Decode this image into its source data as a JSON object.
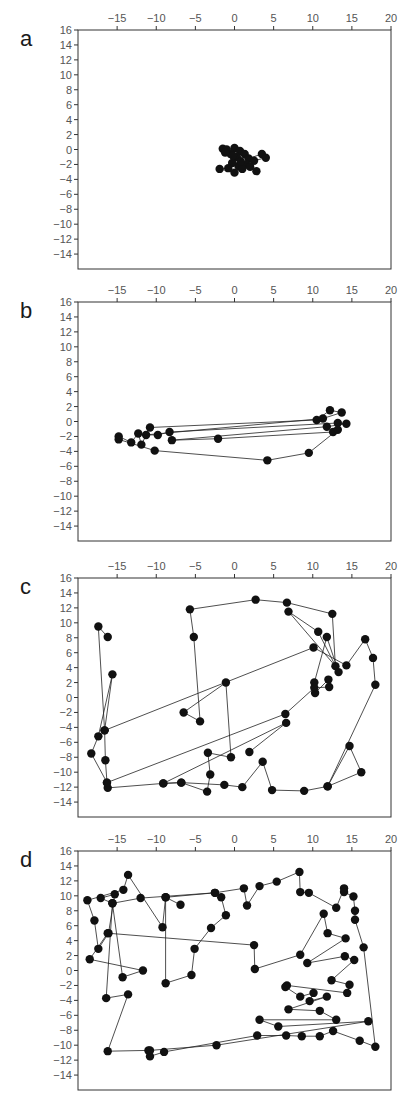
{
  "figure": {
    "axis_color": "#333333",
    "line_color": "#222222",
    "marker_color": "#111111",
    "tick_label_color": "#555555"
  },
  "chart_data": [
    {
      "type": "line",
      "panel_label": "a",
      "title": "",
      "xlabel": "",
      "ylabel": "",
      "xlim": [
        -20,
        20
      ],
      "ylim": [
        -16,
        16
      ],
      "xticks": [
        -15,
        -10,
        -5,
        0,
        5,
        10,
        15,
        20
      ],
      "yticks": [
        16,
        14,
        12,
        10,
        8,
        6,
        4,
        2,
        0,
        -2,
        -4,
        -6,
        -8,
        -10,
        -12,
        -14
      ],
      "x_axis_position": "top",
      "grid": false,
      "legend": null,
      "series": [
        {
          "name": "trajectory",
          "marker": "circle",
          "x": [
            -1.5,
            -1.0,
            0.0,
            0.7,
            1.3,
            -0.5,
            0.3,
            1.8,
            3.5,
            4.0,
            2.5,
            1.5,
            0.5,
            -0.3,
            -0.8,
            -1.9,
            0.0,
            1.0,
            2.0,
            2.8,
            -0.2,
            0.8,
            -1.2
          ],
          "y": [
            0.1,
            0.0,
            0.2,
            -0.2,
            -0.6,
            -0.6,
            -1.0,
            -1.2,
            -0.6,
            -1.1,
            -1.5,
            -2.0,
            -2.2,
            -1.8,
            -2.5,
            -2.6,
            -3.1,
            -2.6,
            -2.3,
            -2.9,
            -0.8,
            -1.6,
            -0.4
          ]
        }
      ]
    },
    {
      "type": "line",
      "panel_label": "b",
      "title": "",
      "xlabel": "",
      "ylabel": "",
      "xlim": [
        -20,
        20
      ],
      "ylim": [
        -16,
        16
      ],
      "xticks": [
        -15,
        -10,
        -5,
        0,
        5,
        10,
        15,
        20
      ],
      "yticks": [
        16,
        14,
        12,
        10,
        8,
        6,
        4,
        2,
        0,
        -2,
        -4,
        -6,
        -8,
        -10,
        -12,
        -14
      ],
      "x_axis_position": "top",
      "grid": false,
      "legend": null,
      "series": [
        {
          "name": "trajectory",
          "marker": "circle",
          "x": [
            -14.8,
            -13.2,
            -12.3,
            -11.9,
            -10.8,
            10.5,
            12.2,
            13.7,
            11.3,
            -11.3,
            -9.8,
            -8.3,
            13.2,
            14.3,
            11.8,
            -8.0,
            -2.1,
            12.6,
            13.2,
            9.5,
            4.2,
            -10.2,
            -14.8
          ],
          "y": [
            -2.0,
            -2.8,
            -1.6,
            -3.1,
            -0.8,
            0.2,
            1.5,
            1.2,
            0.4,
            -1.8,
            -1.8,
            -1.4,
            -0.2,
            -0.3,
            -0.7,
            -2.5,
            -2.3,
            -1.4,
            -1.1,
            -4.2,
            -5.2,
            -3.9,
            -2.4
          ]
        }
      ]
    },
    {
      "type": "line",
      "panel_label": "c",
      "title": "",
      "xlabel": "",
      "ylabel": "",
      "xlim": [
        -20,
        20
      ],
      "ylim": [
        -16,
        16
      ],
      "xticks": [
        -15,
        -10,
        -5,
        0,
        5,
        10,
        15,
        20
      ],
      "yticks": [
        16,
        14,
        12,
        10,
        8,
        6,
        4,
        2,
        0,
        -2,
        -4,
        -6,
        -8,
        -10,
        -12,
        -14
      ],
      "x_axis_position": "top",
      "grid": false,
      "legend": null,
      "series": [
        {
          "name": "trajectory",
          "marker": "circle",
          "x": [
            -16.2,
            -17.4,
            -16.6,
            -15.6,
            -17.4,
            -18.3,
            -16.3,
            -16.2,
            -9.1,
            -6.8,
            -3.5,
            -3.1,
            -3.4,
            -0.45,
            -1.1,
            -6.5,
            -4.4,
            -5.2,
            -5.7,
            2.7,
            6.7,
            12.5,
            12.9,
            6.9,
            10.7,
            13.3,
            11.8,
            10.2,
            10.3,
            12.0,
            12.1,
            10.2,
            6.5,
            -16.3,
            -16.5,
            -16.6,
            10.1,
            14.3,
            16.7,
            17.7,
            18.0,
            11.9,
            14.7,
            16.2,
            11.9,
            8.9,
            4.8,
            3.6,
            1.0,
            -1.3,
            -6.8,
            -9.1,
            6.6,
            1.9
          ],
          "y": [
            8.1,
            9.5,
            -4.4,
            3.1,
            -5.2,
            -7.5,
            -11.4,
            -12.1,
            -11.5,
            -11.4,
            -12.6,
            -10.3,
            -7.4,
            -8.0,
            2.0,
            -2.0,
            -3.2,
            8.1,
            11.8,
            13.1,
            12.7,
            11.2,
            4.2,
            11.5,
            8.8,
            3.4,
            8.1,
            2.0,
            0.6,
            2.4,
            1.4,
            1.3,
            -2.2,
            -11.4,
            -8.4,
            -4.4,
            6.7,
            4.3,
            7.8,
            5.3,
            1.7,
            -11.9,
            -6.5,
            -10.0,
            -11.9,
            -12.5,
            -12.4,
            -8.6,
            -12.0,
            -11.7,
            -11.4,
            -11.5,
            -3.4,
            -7.3
          ]
        }
      ]
    },
    {
      "type": "line",
      "panel_label": "d",
      "title": "",
      "xlabel": "",
      "ylabel": "",
      "xlim": [
        -20,
        20
      ],
      "ylim": [
        -16,
        16
      ],
      "xticks": [
        -15,
        -10,
        -5,
        0,
        5,
        10,
        15,
        20
      ],
      "yticks": [
        16,
        14,
        12,
        10,
        8,
        6,
        4,
        2,
        0,
        -2,
        -4,
        -6,
        -8,
        -10,
        -12,
        -14
      ],
      "x_axis_position": "top",
      "grid": false,
      "legend": null,
      "series": [
        {
          "name": "trajectory",
          "marker": "circle",
          "x": [
            -6.9,
            -8.8,
            -9.2,
            -13.6,
            -14.2,
            -18.8,
            -17.9,
            -17.4,
            -16.1,
            -15.3,
            -17.1,
            -15.6,
            -12.0,
            -2.5,
            -1.7,
            -1.1,
            -3.0,
            -5.1,
            -5.5,
            -8.8,
            -8.8,
            -2.5,
            1.2,
            1.6,
            3.2,
            5.4,
            8.3,
            8.4,
            9.5,
            13.0,
            14.0,
            14.0,
            15.2,
            15.4,
            15.4,
            16.5,
            18.0,
            16.0,
            12.6,
            10.9,
            8.6,
            6.6,
            2.9,
            -9.0,
            -10.8,
            -11.0,
            -16.2,
            -13.6,
            -16.4,
            -15.6,
            -14.3,
            -11.7,
            -18.5,
            -16.2,
            2.5,
            2.6,
            8.4,
            11.4,
            11.9,
            14.2,
            9.3,
            14.1,
            15.3,
            12.4,
            14.7,
            14.4,
            6.7,
            6.5,
            8.4,
            10.1,
            9.6,
            11.8,
            6.9,
            10.9,
            13.0,
            3.2,
            5.6,
            17.1,
            -2.3,
            -10.8
          ],
          "y": [
            8.8,
            9.8,
            5.8,
            12.8,
            10.8,
            9.4,
            6.7,
            2.9,
            5.0,
            10.2,
            9.7,
            9.0,
            9.7,
            10.4,
            9.8,
            7.4,
            5.7,
            2.9,
            -0.6,
            -1.7,
            9.8,
            10.4,
            11.0,
            8.7,
            11.3,
            11.9,
            13.2,
            10.5,
            10.4,
            8.4,
            11.0,
            10.5,
            9.9,
            8.0,
            6.8,
            3.1,
            -10.2,
            -9.4,
            -8.1,
            -8.8,
            -8.8,
            -8.7,
            -8.7,
            -10.9,
            -11.5,
            -10.7,
            -10.8,
            -3.2,
            -3.7,
            9.0,
            -0.9,
            0.0,
            1.5,
            5.0,
            3.4,
            0.2,
            2.1,
            7.6,
            5.0,
            4.3,
            1.0,
            1.9,
            1.4,
            -1.3,
            -1.9,
            -3.0,
            -2.0,
            -2.2,
            -3.5,
            -3.0,
            -4.1,
            -3.5,
            -5.2,
            -5.4,
            -6.6,
            -6.6,
            -7.5,
            -6.8,
            -10.0,
            -10.7
          ]
        }
      ]
    }
  ]
}
